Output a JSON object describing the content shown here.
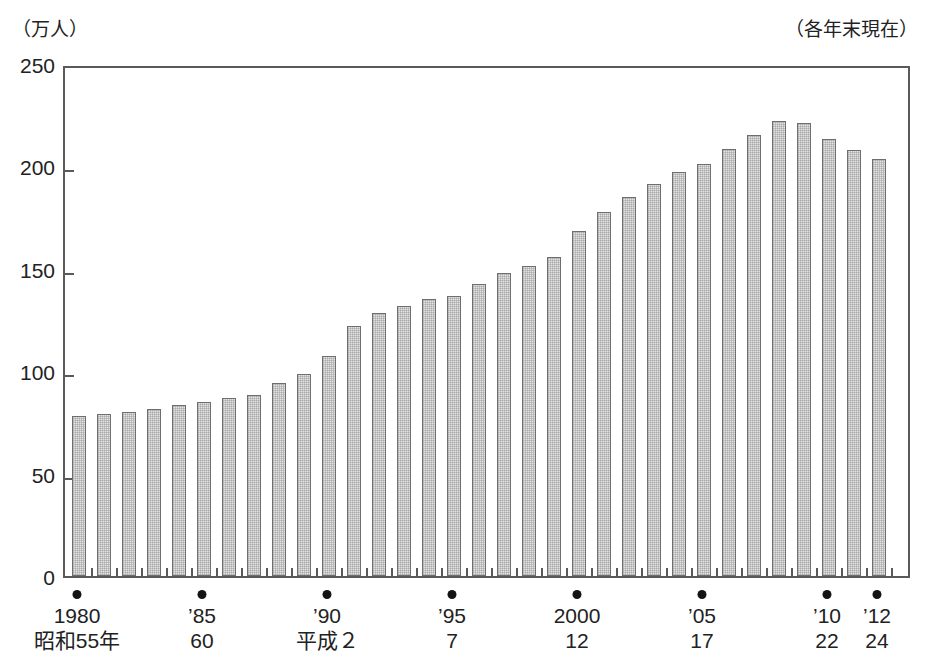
{
  "figure": {
    "unit_label": "（万人）",
    "asof_label": "（各年末現在）"
  },
  "chart_data": {
    "type": "bar",
    "title": "",
    "subtitle": "",
    "xlabel": "",
    "ylabel": "（万人）",
    "annotation": "（各年末現在）",
    "ylim": [
      0,
      250
    ],
    "yticks": [
      0,
      50,
      100,
      150,
      200,
      250
    ],
    "grid": false,
    "legend": null,
    "categories": [
      "1980",
      "1981",
      "1982",
      "1983",
      "1984",
      "1985",
      "1986",
      "1987",
      "1988",
      "1989",
      "1990",
      "1991",
      "1992",
      "1993",
      "1994",
      "1995",
      "1996",
      "1997",
      "1998",
      "1999",
      "2000",
      "2001",
      "2002",
      "2003",
      "2004",
      "2005",
      "2006",
      "2007",
      "2008",
      "2009",
      "2010",
      "2011",
      "2012"
    ],
    "values": [
      78.3,
      79.2,
      80.2,
      81.7,
      83.5,
      85.1,
      86.7,
      88.4,
      94.1,
      98.4,
      107.5,
      121.9,
      128.2,
      132.0,
      135.4,
      136.9,
      142.8,
      148.2,
      151.4,
      155.6,
      168.6,
      177.8,
      185.1,
      191.4,
      197.2,
      201.1,
      208.4,
      215.5,
      222.2,
      221.0,
      213.4,
      207.8,
      203.5
    ],
    "labeled_years": [
      {
        "category": "1980",
        "line1": "1980",
        "line2": "昭和55年"
      },
      {
        "category": "1985",
        "line1": "’85",
        "line2": "60"
      },
      {
        "category": "1990",
        "line1": "’90",
        "line2": "平成２"
      },
      {
        "category": "1995",
        "line1": "’95",
        "line2": "7"
      },
      {
        "category": "2000",
        "line1": "2000",
        "line2": "12"
      },
      {
        "category": "2005",
        "line1": "’05",
        "line2": "17"
      },
      {
        "category": "2010",
        "line1": "’10",
        "line2": "22"
      },
      {
        "category": "2012",
        "line1": "’12",
        "line2": "24"
      }
    ],
    "colors": {
      "bar_fill": "#e3e3e3",
      "bar_border": "#6e6e6e",
      "axis": "#5a5a5a",
      "text": "#222222",
      "marker_dot": "#141414"
    }
  }
}
